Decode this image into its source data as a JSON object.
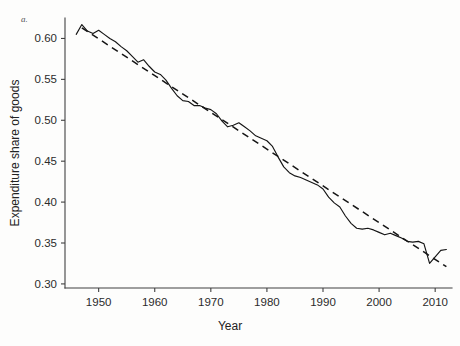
{
  "figure": {
    "panel_label": "a.",
    "background_color": "#fdfdfc",
    "ink_color": "#151515"
  },
  "chart_data": {
    "type": "line",
    "title": "",
    "subtitle": "",
    "xlabel": "Year",
    "ylabel": "Expenditure share of goods",
    "xlim": [
      1944,
      2013
    ],
    "ylim": [
      0.295,
      0.625
    ],
    "xticks": [
      1950,
      1960,
      1970,
      1980,
      1990,
      2000,
      2010
    ],
    "xticklabels": [
      "1950",
      "1960",
      "1970",
      "1980",
      "1990",
      "2000",
      "2010"
    ],
    "yticks": [
      0.3,
      0.35,
      0.4,
      0.45,
      0.5,
      0.55,
      0.6
    ],
    "yticklabels": [
      "0.30",
      "0.35",
      "0.40",
      "0.45",
      "0.50",
      "0.55",
      "0.60"
    ],
    "grid": false,
    "legend": "none",
    "legend_position": "none",
    "annotations": [
      "a."
    ],
    "series": [
      {
        "name": "Expenditure share of goods (annual)",
        "style": "solid",
        "color": "#151515",
        "x": [
          1946,
          1947,
          1948,
          1949,
          1950,
          1951,
          1952,
          1953,
          1954,
          1955,
          1956,
          1957,
          1958,
          1959,
          1960,
          1961,
          1962,
          1963,
          1964,
          1965,
          1966,
          1967,
          1968,
          1969,
          1970,
          1971,
          1972,
          1973,
          1974,
          1975,
          1976,
          1977,
          1978,
          1979,
          1980,
          1981,
          1982,
          1983,
          1984,
          1985,
          1986,
          1987,
          1988,
          1989,
          1990,
          1991,
          1992,
          1993,
          1994,
          1995,
          1996,
          1997,
          1998,
          1999,
          2000,
          2001,
          2002,
          2003,
          2004,
          2005,
          2006,
          2007,
          2008,
          2009,
          2010,
          2011,
          2012
        ],
        "values": [
          0.605,
          0.617,
          0.609,
          0.606,
          0.61,
          0.605,
          0.6,
          0.596,
          0.59,
          0.585,
          0.578,
          0.571,
          0.574,
          0.566,
          0.559,
          0.556,
          0.549,
          0.539,
          0.53,
          0.524,
          0.523,
          0.518,
          0.518,
          0.515,
          0.513,
          0.508,
          0.499,
          0.492,
          0.494,
          0.497,
          0.492,
          0.487,
          0.481,
          0.478,
          0.475,
          0.468,
          0.455,
          0.443,
          0.436,
          0.432,
          0.43,
          0.427,
          0.424,
          0.421,
          0.416,
          0.406,
          0.399,
          0.394,
          0.383,
          0.374,
          0.368,
          0.367,
          0.368,
          0.366,
          0.363,
          0.36,
          0.362,
          0.359,
          0.356,
          0.352,
          0.351,
          0.352,
          0.349,
          0.325,
          0.333,
          0.341,
          0.342
        ]
      },
      {
        "name": "Linear trend",
        "style": "dashed",
        "color": "#151515",
        "x": [
          1947,
          2012
        ],
        "values": [
          0.613,
          0.321
        ]
      }
    ]
  }
}
